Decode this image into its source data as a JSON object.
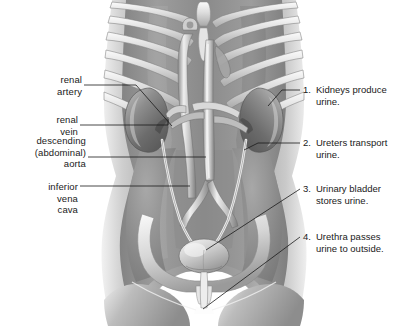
{
  "figure": {
    "kind": "anatomy-illustration",
    "style": "grayscale medical illustration",
    "background_color": "#ffffff",
    "leader_line_color": "#1a1a1a"
  },
  "left_labels": [
    {
      "id": "renal-artery",
      "text": "renal\nartery"
    },
    {
      "id": "renal-vein",
      "text": "renal\nvein"
    },
    {
      "id": "descending-aorta",
      "text": "descending\n(abdominal)\naorta"
    },
    {
      "id": "inferior-vena-cava",
      "text": "inferior\nvena\ncava"
    }
  ],
  "right_items": [
    {
      "number": "1.",
      "text": "Kidneys produce\nurine."
    },
    {
      "number": "2.",
      "text": "Ureters transport\nurine."
    },
    {
      "number": "3.",
      "text": "Urinary bladder\nstores urine."
    },
    {
      "number": "4.",
      "text": "Urethra passes\nurine to outside."
    }
  ],
  "structures": [
    "ribcage",
    "sternum",
    "xiphoid process",
    "left kidney",
    "right kidney",
    "renal artery",
    "renal vein",
    "abdominal aorta",
    "inferior vena cava",
    "ureters",
    "urinary bladder",
    "urethra",
    "pelvis",
    "iliac vessels",
    "psoas muscle",
    "thighs"
  ]
}
